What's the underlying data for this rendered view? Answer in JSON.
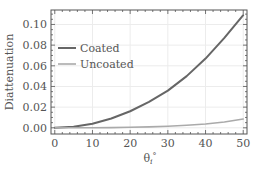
{
  "chart_data": {
    "type": "line",
    "title": "",
    "xlabel": "θ",
    "xlabel_sub": "i",
    "xlabel_sup": "°",
    "ylabel": "Diattenuation",
    "xlim": [
      -1,
      51
    ],
    "ylim": [
      -0.006,
      0.114
    ],
    "xticks": [
      0,
      10,
      20,
      30,
      40,
      50
    ],
    "xtick_labels": [
      "0",
      "10",
      "20",
      "30",
      "40",
      "50"
    ],
    "yticks": [
      0.0,
      0.02,
      0.04,
      0.06,
      0.08,
      0.1
    ],
    "ytick_labels": [
      "0.00",
      "0.02",
      "0.04",
      "0.06",
      "0.08",
      "0.10"
    ],
    "grid": true,
    "legend_position": "upper left",
    "x": [
      0,
      5,
      10,
      15,
      20,
      25,
      30,
      35,
      40,
      45,
      50
    ],
    "series": [
      {
        "name": "Coated",
        "color": "#666666",
        "values": [
          0.0,
          0.001,
          0.004,
          0.009,
          0.016,
          0.025,
          0.036,
          0.05,
          0.067,
          0.087,
          0.109
        ]
      },
      {
        "name": "Uncoated",
        "color": "#aaaaaa",
        "values": [
          0.0,
          0.0,
          0.0001,
          0.0002,
          0.0005,
          0.0009,
          0.0015,
          0.0024,
          0.0037,
          0.0056,
          0.0085
        ]
      }
    ]
  }
}
